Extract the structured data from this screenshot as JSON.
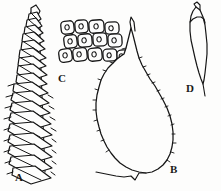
{
  "plate": {
    "type": "scientific-line-drawing",
    "subject": "moss (bryophyte) morphology plate",
    "background_color": "#fdfdfc",
    "ink_color": "#161616",
    "width": 221,
    "height": 191,
    "style": "black-and-white pen-and-ink botanical illustration"
  },
  "figures": [
    {
      "key": "A",
      "label": "A",
      "name": "leafy-shoot",
      "description": "Elongate moss shoot with imbricate, spreading pointed leaves arranged spirally along a vertical stem; narrow at the apex, broadening downward.",
      "label_position": {
        "x": 15,
        "y": 172
      },
      "orientation": "vertical",
      "region": {
        "x": 4,
        "y": 4,
        "width": 52,
        "height": 184
      }
    },
    {
      "key": "B",
      "label": "B",
      "name": "leaf-broadly-ovate",
      "description": "Large broadly ovate leaf with a long narrow acuminate apex, rounded to cordate base and finely crenulate-denticulate margins.",
      "label_position": {
        "x": 170,
        "y": 164
      },
      "orientation": "upright",
      "region": {
        "x": 92,
        "y": 24,
        "width": 88,
        "height": 160
      }
    },
    {
      "key": "C",
      "label": "C",
      "name": "leaf-cells-papillose",
      "description": "Cluster of about fourteen rounded-quadrate to oblong leaf cells in three oblique rows, each bearing a central papilla.",
      "label_position": {
        "x": 58,
        "y": 73
      },
      "orientation": "oblique rows",
      "region": {
        "x": 58,
        "y": 14,
        "width": 70,
        "height": 58
      },
      "cell_count": 14,
      "rows": 3
    },
    {
      "key": "D",
      "label": "D",
      "name": "leaf-lanceolate",
      "description": "Narrow lanceolate to oblong leaf with a blunt hooded (cucullate) apex and entire margins, tapering to a slender base.",
      "label_position": {
        "x": 186,
        "y": 83
      },
      "orientation": "upright",
      "region": {
        "x": 182,
        "y": 4,
        "width": 30,
        "height": 82
      }
    }
  ]
}
